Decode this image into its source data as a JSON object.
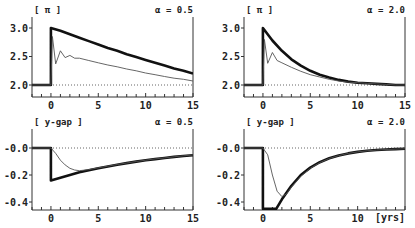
{
  "chart_data": [
    {
      "type": "line",
      "panel": "top-left",
      "title": "[ π ]",
      "annotation": "α = 0.5",
      "xlabel": "",
      "ylabel": "π",
      "xlim": [
        -2,
        15
      ],
      "ylim": [
        1.8,
        3.2
      ],
      "xticks": [
        0,
        5,
        10,
        15
      ],
      "yticks": [
        2.0,
        2.5,
        3.0
      ],
      "ytick_labels": [
        "2.0",
        "2.5",
        "3.0"
      ],
      "reference_line": 2.0,
      "series": [
        {
          "name": "thick",
          "style": "thick",
          "x": [
            -2,
            0,
            0,
            1,
            2,
            3,
            4,
            5,
            6,
            7,
            8,
            9,
            10,
            11,
            12,
            13,
            14,
            15
          ],
          "y": [
            2.0,
            2.0,
            3.0,
            2.95,
            2.89,
            2.83,
            2.77,
            2.71,
            2.65,
            2.6,
            2.54,
            2.49,
            2.44,
            2.39,
            2.34,
            2.29,
            2.25,
            2.2
          ]
        },
        {
          "name": "thin",
          "style": "thin",
          "x": [
            -2,
            0,
            0.15,
            0.5,
            1.0,
            1.5,
            2.0,
            2.5,
            3,
            4,
            5,
            6,
            7,
            8,
            9,
            10,
            11,
            12,
            13,
            14,
            15
          ],
          "y": [
            2.0,
            2.0,
            2.85,
            2.37,
            2.6,
            2.48,
            2.52,
            2.47,
            2.47,
            2.43,
            2.39,
            2.35,
            2.32,
            2.28,
            2.25,
            2.21,
            2.18,
            2.15,
            2.12,
            2.1,
            2.07
          ]
        }
      ]
    },
    {
      "type": "line",
      "panel": "top-right",
      "title": "[ π ]",
      "annotation": "α = 2.0",
      "xlabel": "",
      "ylabel": "π",
      "xlim": [
        -2,
        15
      ],
      "ylim": [
        1.8,
        3.2
      ],
      "xticks": [
        0,
        5,
        10,
        15
      ],
      "yticks": [
        2.0,
        2.5,
        3.0
      ],
      "ytick_labels": [
        "2.0",
        "2.5",
        "3.0"
      ],
      "reference_line": 2.0,
      "series": [
        {
          "name": "thick",
          "style": "thick",
          "x": [
            -2,
            0,
            0,
            1,
            2,
            3,
            4,
            5,
            6,
            7,
            8,
            9,
            10,
            11,
            12,
            13,
            14,
            15
          ],
          "y": [
            2.0,
            2.0,
            3.0,
            2.78,
            2.6,
            2.45,
            2.34,
            2.25,
            2.18,
            2.13,
            2.09,
            2.06,
            2.04,
            2.03,
            2.02,
            2.01,
            2.0,
            2.0
          ]
        },
        {
          "name": "thin",
          "style": "thin",
          "x": [
            -2,
            0,
            0.15,
            0.5,
            1.0,
            1.5,
            2,
            3,
            4,
            5,
            6,
            7,
            8,
            9,
            10,
            11,
            12,
            13,
            14,
            15
          ],
          "y": [
            2.0,
            2.0,
            2.8,
            2.38,
            2.57,
            2.43,
            2.39,
            2.31,
            2.24,
            2.18,
            2.14,
            2.1,
            2.07,
            2.05,
            2.04,
            2.03,
            2.02,
            2.01,
            2.0,
            2.0
          ]
        }
      ]
    },
    {
      "type": "line",
      "panel": "bottom-left",
      "title": "[ y-gap ]",
      "annotation": "α = 0.5",
      "xlabel": "",
      "ylabel": "y-gap",
      "xlim": [
        -2,
        15
      ],
      "ylim": [
        -0.45,
        0.05
      ],
      "xticks": [
        0,
        5,
        10,
        15
      ],
      "yticks": [
        0.0,
        -0.2,
        -0.4
      ],
      "ytick_labels": [
        "-0.0",
        "-0.2",
        "-0.4"
      ],
      "reference_line": 0.0,
      "series": [
        {
          "name": "thick",
          "style": "thick",
          "x": [
            -2,
            0,
            0,
            1,
            2,
            3,
            4,
            5,
            6,
            7,
            8,
            9,
            10,
            11,
            12,
            13,
            14,
            15
          ],
          "y": [
            0.0,
            0.0,
            -0.24,
            -0.22,
            -0.2,
            -0.18,
            -0.165,
            -0.15,
            -0.137,
            -0.124,
            -0.112,
            -0.101,
            -0.091,
            -0.082,
            -0.074,
            -0.066,
            -0.059,
            -0.053
          ]
        },
        {
          "name": "thin",
          "style": "thin",
          "x": [
            -2,
            0,
            0.5,
            1,
            1.5,
            2,
            2.5,
            3,
            4,
            5,
            6,
            7,
            8,
            9,
            10,
            11,
            12,
            13,
            14,
            15
          ],
          "y": [
            0.0,
            0.0,
            -0.04,
            -0.09,
            -0.125,
            -0.15,
            -0.163,
            -0.168,
            -0.16,
            -0.147,
            -0.135,
            -0.122,
            -0.111,
            -0.1,
            -0.09,
            -0.081,
            -0.073,
            -0.065,
            -0.058,
            -0.052
          ]
        }
      ]
    },
    {
      "type": "line",
      "panel": "bottom-right",
      "title": "[ y-gap ]",
      "annotation": "α = 2.0",
      "xlabel": "[yrs]",
      "ylabel": "y-gap",
      "xlim": [
        -2,
        15
      ],
      "ylim": [
        -0.45,
        0.05
      ],
      "xticks": [
        0,
        5,
        10
      ],
      "yticks": [
        0.0,
        -0.2,
        -0.4
      ],
      "ytick_labels": [
        "-0.0",
        "-0.2",
        "-0.4"
      ],
      "reference_line": 0.0,
      "series": [
        {
          "name": "thick",
          "style": "thick",
          "x": [
            -2,
            0,
            0,
            1.4,
            2,
            3,
            4,
            5,
            6,
            7,
            8,
            9,
            10,
            11,
            12,
            13,
            14,
            15
          ],
          "y": [
            0.0,
            0.0,
            -0.45,
            -0.45,
            -0.38,
            -0.28,
            -0.2,
            -0.145,
            -0.105,
            -0.076,
            -0.055,
            -0.04,
            -0.029,
            -0.021,
            -0.015,
            -0.011,
            -0.008,
            -0.006
          ]
        },
        {
          "name": "thin",
          "style": "thin",
          "x": [
            -2,
            0,
            0.5,
            1,
            1.5,
            2,
            2.5,
            3,
            4,
            5,
            6,
            7,
            8,
            9,
            10,
            11,
            12,
            13,
            14,
            15
          ],
          "y": [
            0.0,
            0.0,
            -0.05,
            -0.2,
            -0.32,
            -0.36,
            -0.34,
            -0.29,
            -0.21,
            -0.15,
            -0.108,
            -0.078,
            -0.056,
            -0.04,
            -0.029,
            -0.021,
            -0.015,
            -0.011,
            -0.008,
            -0.006
          ]
        }
      ]
    }
  ],
  "panels": [
    {
      "title": "[ π ]",
      "annotation": "α = 0.5",
      "xlabel": "",
      "xtick_labels": [
        "0",
        "5",
        "10",
        "15"
      ],
      "ytick_labels": [
        "3.0",
        "2.5",
        "2.0"
      ]
    },
    {
      "title": "[ π ]",
      "annotation": "α = 2.0",
      "xlabel": "",
      "xtick_labels": [
        "0",
        "5",
        "10",
        "15"
      ],
      "ytick_labels": [
        "3.0",
        "2.5",
        "2.0"
      ]
    },
    {
      "title": "[ y-gap ]",
      "annotation": "α = 0.5",
      "xlabel": "",
      "xtick_labels": [
        "0",
        "5",
        "10",
        "15"
      ],
      "ytick_labels": [
        "-0.0",
        "-0.2",
        "-0.4"
      ]
    },
    {
      "title": "[ y-gap ]",
      "annotation": "α = 2.0",
      "xlabel": "[yrs]",
      "xtick_labels": [
        "0",
        "5",
        "10"
      ],
      "ytick_labels": [
        "-0.0",
        "-0.2",
        "-0.4"
      ]
    }
  ],
  "colors": {
    "axis": "#333333",
    "thick_line": "#111111",
    "thin_line": "#555555",
    "reference": "#666666",
    "text": "#222222"
  }
}
